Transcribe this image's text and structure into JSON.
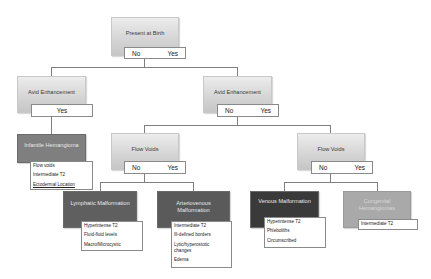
{
  "diagram": {
    "root": {
      "label": "Present at Birth",
      "options": [
        "No",
        "Yes"
      ]
    },
    "left_branch": {
      "label": "Avid Enhancement",
      "options": [
        "Yes"
      ],
      "result": {
        "label": "Infantile Hemangioma",
        "features": [
          "Flow voids",
          "Intermediate T2",
          "Ectodermal Location"
        ],
        "color": "#7f7f7f"
      }
    },
    "right_branch": {
      "label": "Avid Enhancement",
      "options": [
        "No",
        "Yes"
      ],
      "no_branch": {
        "label": "Flow Voids",
        "options": [
          "No",
          "Yes"
        ],
        "no_result": {
          "label": "Lymphatic Malformation",
          "features": [
            "Hyperintense T2",
            "Fluid-fluid levels",
            "Macro/Microcystic"
          ],
          "color": "#5f5f5f"
        },
        "yes_result": {
          "label": "Arteriovenous Malformation",
          "features": [
            "Intermediate T2",
            "Ill-defined borders",
            "Lytic/hyperostotic changes",
            "Edema"
          ],
          "color": "#5a5a5a"
        }
      },
      "yes_branch": {
        "label": "Flow Voids",
        "options": [
          "No",
          "Yes"
        ],
        "no_result": {
          "label": "Venous Malformation",
          "features": [
            "Hyperintense T2",
            "Phleboliths",
            "Circumscribed"
          ],
          "color": "#3a3a3a"
        },
        "yes_result": {
          "label": "Congenital Hemangiomas",
          "features": [
            "Intermediate T2"
          ],
          "color": "#a9a9a9"
        }
      }
    }
  }
}
